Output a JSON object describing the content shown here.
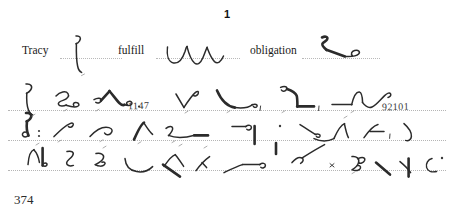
{
  "document": {
    "type": "shorthand-dictation-worksheet",
    "page_number": "374",
    "exercise_number": "1",
    "ink_color": "#2b2b2b",
    "rule_color": "#b5b5b5",
    "background_color": "#ffffff"
  },
  "prompts": [
    {
      "word": "Tracy",
      "outline_name": "shorthand-outline-tracy"
    },
    {
      "word": "fulfill",
      "outline_name": "shorthand-outline-fulfill"
    },
    {
      "word": "obligation",
      "outline_name": "shorthand-outline-obligation"
    }
  ],
  "dictation": {
    "lines": [
      {
        "name": "shorthand-line-1",
        "handwritten_numbers": [
          "1147"
        ]
      },
      {
        "name": "shorthand-line-2",
        "handwritten_numbers": []
      },
      {
        "name": "shorthand-line-3",
        "handwritten_numbers": []
      }
    ],
    "handwritten_number_1": "1147",
    "handwritten_number_2": "92101"
  }
}
